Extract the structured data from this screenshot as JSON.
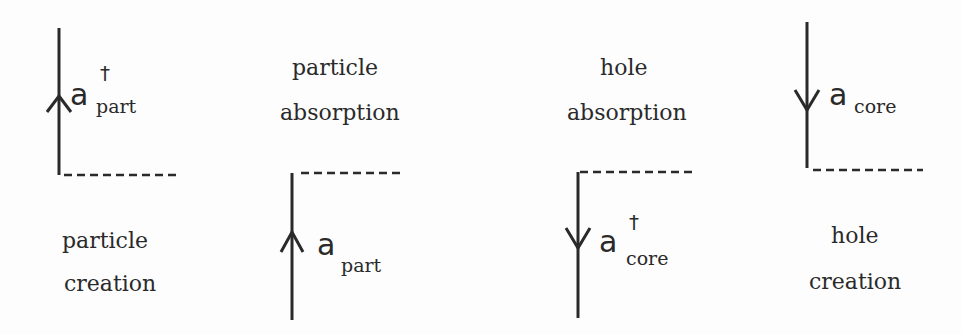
{
  "diagrams": [
    {
      "id": "particle-creation",
      "operator": "a",
      "dagger": "†",
      "subscript": "part",
      "arrow_direction": "up",
      "label_line1": "particle",
      "label_line2": "creation"
    },
    {
      "id": "particle-absorption",
      "operator": "a",
      "dagger": "",
      "subscript": "part",
      "arrow_direction": "up",
      "label_line1": "particle",
      "label_line2": "absorption"
    },
    {
      "id": "hole-absorption",
      "operator": "a",
      "dagger": "†",
      "subscript": "core",
      "arrow_direction": "down",
      "label_line1": "hole",
      "label_line2": "absorption"
    },
    {
      "id": "hole-creation",
      "operator": "a",
      "dagger": "",
      "subscript": "core",
      "arrow_direction": "down",
      "label_line1": "hole",
      "label_line2": "creation"
    }
  ],
  "colors": {
    "ink": "#2a2a2a",
    "background": "#fdfdfd"
  }
}
